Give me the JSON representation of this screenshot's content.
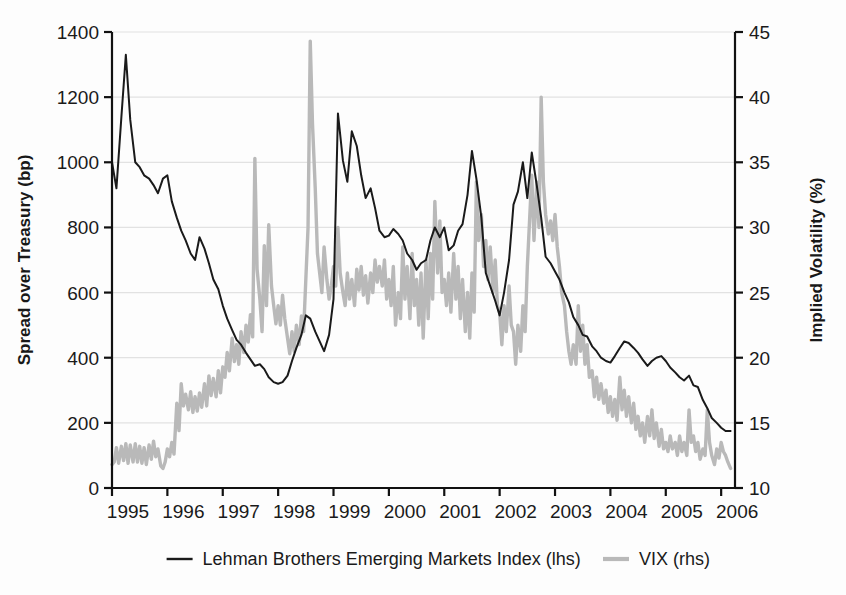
{
  "chart_data": {
    "type": "line",
    "title": "",
    "xlabel": "",
    "grid": true,
    "legend_position": "bottom",
    "x_axis": {
      "tick_labels": [
        "1995",
        "1996",
        "1997",
        "1998",
        "1999",
        "2000",
        "2001",
        "2002",
        "2003",
        "2004",
        "2005",
        "2006"
      ],
      "range": [
        1995,
        2006.25
      ]
    },
    "y_left": {
      "label": "Spread over Treasury (bp)",
      "ticks": [
        0,
        200,
        400,
        600,
        800,
        1000,
        1200,
        1400
      ],
      "tick_labels": [
        "0",
        "200",
        "400",
        "600",
        "800",
        "1000",
        "1200",
        "1400"
      ],
      "ylim": [
        0,
        1400
      ]
    },
    "y_right": {
      "label": "Implied Volatility (%)",
      "ticks": [
        10,
        15,
        20,
        25,
        30,
        35,
        40,
        45
      ],
      "tick_labels": [
        "10",
        "15",
        "20",
        "25",
        "30",
        "35",
        "40",
        "45"
      ],
      "ylim": [
        10,
        45
      ]
    },
    "colors": {
      "lehman": "#1a1a1a",
      "vix": "#b9b9b9",
      "grid": "#e2e2e2",
      "axis": "#111111"
    },
    "series": [
      {
        "name": "Lehman Brothers Emerging Markets Index (lhs)",
        "axis": "left",
        "color": "#1a1a1a",
        "x": [
          1995.0,
          1995.08,
          1995.17,
          1995.25,
          1995.33,
          1995.42,
          1995.5,
          1995.58,
          1995.67,
          1995.75,
          1995.83,
          1995.92,
          1996.0,
          1996.08,
          1996.17,
          1996.25,
          1996.33,
          1996.42,
          1996.5,
          1996.58,
          1996.67,
          1996.75,
          1996.83,
          1996.92,
          1997.0,
          1997.08,
          1997.17,
          1997.25,
          1997.33,
          1997.42,
          1997.5,
          1997.58,
          1997.67,
          1997.75,
          1997.83,
          1997.92,
          1998.0,
          1998.08,
          1998.17,
          1998.25,
          1998.33,
          1998.42,
          1998.5,
          1998.58,
          1998.67,
          1998.75,
          1998.83,
          1998.92,
          1999.0,
          1999.08,
          1999.17,
          1999.25,
          1999.33,
          1999.42,
          1999.5,
          1999.58,
          1999.67,
          1999.75,
          1999.83,
          1999.92,
          2000.0,
          2000.08,
          2000.17,
          2000.25,
          2000.33,
          2000.42,
          2000.5,
          2000.58,
          2000.67,
          2000.75,
          2000.83,
          2000.92,
          2001.0,
          2001.08,
          2001.17,
          2001.25,
          2001.33,
          2001.42,
          2001.5,
          2001.58,
          2001.67,
          2001.75,
          2001.83,
          2001.92,
          2002.0,
          2002.08,
          2002.17,
          2002.25,
          2002.33,
          2002.42,
          2002.5,
          2002.58,
          2002.67,
          2002.75,
          2002.83,
          2002.92,
          2003.0,
          2003.08,
          2003.17,
          2003.25,
          2003.33,
          2003.42,
          2003.5,
          2003.58,
          2003.67,
          2003.75,
          2003.83,
          2003.92,
          2004.0,
          2004.08,
          2004.17,
          2004.25,
          2004.33,
          2004.42,
          2004.5,
          2004.58,
          2004.67,
          2004.75,
          2004.83,
          2004.92,
          2005.0,
          2005.08,
          2005.17,
          2005.25,
          2005.33,
          2005.42,
          2005.5,
          2005.58,
          2005.67,
          2005.75,
          2005.83,
          2005.92,
          2006.0,
          2006.08,
          2006.17
        ],
        "y": [
          1000,
          920,
          1140,
          1330,
          1130,
          1000,
          985,
          960,
          950,
          930,
          905,
          950,
          960,
          880,
          830,
          790,
          760,
          720,
          700,
          770,
          735,
          690,
          640,
          610,
          560,
          520,
          485,
          455,
          440,
          415,
          395,
          375,
          380,
          365,
          340,
          325,
          320,
          325,
          345,
          390,
          430,
          470,
          530,
          520,
          480,
          450,
          420,
          470,
          580,
          1150,
          1005,
          940,
          1095,
          1050,
          960,
          890,
          920,
          860,
          790,
          770,
          775,
          795,
          780,
          760,
          720,
          700,
          670,
          690,
          700,
          760,
          800,
          770,
          800,
          730,
          745,
          790,
          810,
          900,
          1035,
          950,
          830,
          660,
          620,
          575,
          530,
          600,
          700,
          870,
          910,
          1000,
          890,
          1030,
          930,
          830,
          710,
          690,
          665,
          640,
          600,
          570,
          525,
          500,
          470,
          465,
          435,
          420,
          400,
          390,
          385,
          405,
          430,
          450,
          445,
          430,
          415,
          395,
          375,
          390,
          400,
          405,
          390,
          370,
          355,
          340,
          330,
          345,
          315,
          310,
          270,
          245,
          215,
          200,
          185,
          175,
          175
        ]
      },
      {
        "name": "VIX (rhs)",
        "axis": "right",
        "color": "#b9b9b9",
        "x": [
          1995.0,
          1995.04,
          1995.08,
          1995.12,
          1995.17,
          1995.21,
          1995.25,
          1995.29,
          1995.33,
          1995.38,
          1995.42,
          1995.46,
          1995.5,
          1995.54,
          1995.58,
          1995.62,
          1995.67,
          1995.71,
          1995.75,
          1995.79,
          1995.83,
          1995.88,
          1995.92,
          1995.96,
          1996.0,
          1996.04,
          1996.08,
          1996.12,
          1996.17,
          1996.21,
          1996.25,
          1996.29,
          1996.33,
          1996.38,
          1996.42,
          1996.46,
          1996.5,
          1996.54,
          1996.58,
          1996.62,
          1996.67,
          1996.71,
          1996.75,
          1996.79,
          1996.83,
          1996.88,
          1996.92,
          1996.96,
          1997.0,
          1997.04,
          1997.08,
          1997.12,
          1997.17,
          1997.21,
          1997.25,
          1997.29,
          1997.33,
          1997.38,
          1997.42,
          1997.46,
          1997.5,
          1997.54,
          1997.58,
          1997.62,
          1997.67,
          1997.71,
          1997.75,
          1997.79,
          1997.83,
          1997.88,
          1997.92,
          1997.96,
          1998.0,
          1998.04,
          1998.08,
          1998.12,
          1998.17,
          1998.21,
          1998.25,
          1998.29,
          1998.33,
          1998.38,
          1998.42,
          1998.46,
          1998.5,
          1998.54,
          1998.58,
          1998.62,
          1998.67,
          1998.71,
          1998.75,
          1998.79,
          1998.83,
          1998.88,
          1998.92,
          1998.96,
          1999.0,
          1999.04,
          1999.08,
          1999.12,
          1999.17,
          1999.21,
          1999.25,
          1999.29,
          1999.33,
          1999.38,
          1999.42,
          1999.46,
          1999.5,
          1999.54,
          1999.58,
          1999.62,
          1999.67,
          1999.71,
          1999.75,
          1999.79,
          1999.83,
          1999.88,
          1999.92,
          1999.96,
          2000.0,
          2000.04,
          2000.08,
          2000.12,
          2000.17,
          2000.21,
          2000.25,
          2000.29,
          2000.33,
          2000.38,
          2000.42,
          2000.46,
          2000.5,
          2000.54,
          2000.58,
          2000.62,
          2000.67,
          2000.71,
          2000.75,
          2000.79,
          2000.83,
          2000.88,
          2000.92,
          2000.96,
          2001.0,
          2001.04,
          2001.08,
          2001.12,
          2001.17,
          2001.21,
          2001.25,
          2001.29,
          2001.33,
          2001.38,
          2001.42,
          2001.46,
          2001.5,
          2001.54,
          2001.58,
          2001.62,
          2001.67,
          2001.71,
          2001.75,
          2001.79,
          2001.83,
          2001.88,
          2001.92,
          2001.96,
          2002.0,
          2002.04,
          2002.08,
          2002.12,
          2002.17,
          2002.21,
          2002.25,
          2002.29,
          2002.33,
          2002.38,
          2002.42,
          2002.46,
          2002.5,
          2002.54,
          2002.58,
          2002.62,
          2002.67,
          2002.71,
          2002.75,
          2002.79,
          2002.83,
          2002.88,
          2002.92,
          2002.96,
          2003.0,
          2003.04,
          2003.08,
          2003.12,
          2003.17,
          2003.21,
          2003.25,
          2003.29,
          2003.33,
          2003.38,
          2003.42,
          2003.46,
          2003.5,
          2003.54,
          2003.58,
          2003.62,
          2003.67,
          2003.71,
          2003.75,
          2003.79,
          2003.83,
          2003.88,
          2003.92,
          2003.96,
          2004.0,
          2004.04,
          2004.08,
          2004.12,
          2004.17,
          2004.21,
          2004.25,
          2004.29,
          2004.33,
          2004.38,
          2004.42,
          2004.46,
          2004.5,
          2004.54,
          2004.58,
          2004.62,
          2004.67,
          2004.71,
          2004.75,
          2004.79,
          2004.83,
          2004.88,
          2004.92,
          2004.96,
          2005.0,
          2005.04,
          2005.08,
          2005.12,
          2005.17,
          2005.21,
          2005.25,
          2005.29,
          2005.33,
          2005.38,
          2005.42,
          2005.46,
          2005.5,
          2005.54,
          2005.58,
          2005.62,
          2005.67,
          2005.71,
          2005.75,
          2005.79,
          2005.83,
          2005.88,
          2005.92,
          2005.96,
          2006.0,
          2006.04,
          2006.08,
          2006.12,
          2006.17
        ],
        "y": [
          11.8,
          12.0,
          13.1,
          11.9,
          13.2,
          12.1,
          13.4,
          11.9,
          13.3,
          12.0,
          13.4,
          12.0,
          13.2,
          11.9,
          13.1,
          11.8,
          13.3,
          12.2,
          13.6,
          12.4,
          13.0,
          11.7,
          11.5,
          12.0,
          13.0,
          12.4,
          13.5,
          12.6,
          16.5,
          14.4,
          18.0,
          16.3,
          17.2,
          16.0,
          17.4,
          15.8,
          17.0,
          15.9,
          17.3,
          16.2,
          18.0,
          16.3,
          18.6,
          17.1,
          18.4,
          17.0,
          19.0,
          17.3,
          19.3,
          18.5,
          20.4,
          19.0,
          21.5,
          19.7,
          21.0,
          19.5,
          22.0,
          20.4,
          22.5,
          21.2,
          23.3,
          21.6,
          35.3,
          26.8,
          24.5,
          22.0,
          28.6,
          24.0,
          30.2,
          25.5,
          24.0,
          22.6,
          24.0,
          22.5,
          24.8,
          23.0,
          21.5,
          20.3,
          22.0,
          20.5,
          22.5,
          21.0,
          23.2,
          22.0,
          26.0,
          30.0,
          44.3,
          38.0,
          33.0,
          28.0,
          26.5,
          25.0,
          28.5,
          26.0,
          24.5,
          25.5,
          27.0,
          25.5,
          30.0,
          26.5,
          25.0,
          24.0,
          26.5,
          24.5,
          26.0,
          24.0,
          26.8,
          25.2,
          27.0,
          24.8,
          26.3,
          24.2,
          26.5,
          25.0,
          27.5,
          25.8,
          27.0,
          25.5,
          27.5,
          24.5,
          26.0,
          24.0,
          27.0,
          22.5,
          25.0,
          23.0,
          28.5,
          24.5,
          27.0,
          23.0,
          28.0,
          24.0,
          26.0,
          22.5,
          26.5,
          21.5,
          27.5,
          23.0,
          28.0,
          24.5,
          32.0,
          26.5,
          30.5,
          25.0,
          26.0,
          24.0,
          26.5,
          23.5,
          28.0,
          24.5,
          27.0,
          23.0,
          26.0,
          22.0,
          25.0,
          21.5,
          26.5,
          23.5,
          33.5,
          29.0,
          31.0,
          27.0,
          29.0,
          26.0,
          28.5,
          25.0,
          27.5,
          24.0,
          23.5,
          21.0,
          24.0,
          22.0,
          25.5,
          22.5,
          22.0,
          19.5,
          22.5,
          20.5,
          24.0,
          22.0,
          27.0,
          30.5,
          34.0,
          29.0,
          33.5,
          30.0,
          40.0,
          33.5,
          31.0,
          29.5,
          30.5,
          29.0,
          31.0,
          28.5,
          27.0,
          25.0,
          24.0,
          22.0,
          20.5,
          19.5,
          21.0,
          19.5,
          24.0,
          20.5,
          22.5,
          19.5,
          21.0,
          18.5,
          19.0,
          17.0,
          18.5,
          16.8,
          18.0,
          16.5,
          17.5,
          15.8,
          17.0,
          15.5,
          16.8,
          15.2,
          18.5,
          16.0,
          17.5,
          15.5,
          17.0,
          15.0,
          16.5,
          14.5,
          15.5,
          14.0,
          15.0,
          13.5,
          15.5,
          14.0,
          16.0,
          13.8,
          15.0,
          13.2,
          14.5,
          13.0,
          13.5,
          12.8,
          14.0,
          13.0,
          13.5,
          12.5,
          14.0,
          12.8,
          13.5,
          12.5,
          16.0,
          13.5,
          14.0,
          12.8,
          13.5,
          12.2,
          13.0,
          12.5,
          16.0,
          13.5,
          12.5,
          11.8,
          13.0,
          12.3,
          13.5,
          12.8,
          12.5,
          12.0,
          11.5
        ]
      }
    ],
    "legend": [
      {
        "label": "Lehman Brothers Emerging Markets Index (lhs)",
        "color": "#1a1a1a",
        "marker": "line"
      },
      {
        "label": "VIX (rhs)",
        "color": "#b9b9b9",
        "marker": "line"
      }
    ]
  }
}
